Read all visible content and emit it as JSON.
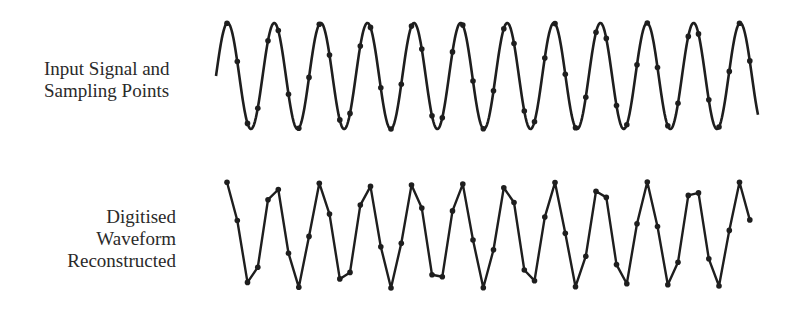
{
  "labels": {
    "top_line1": "Input Signal and",
    "top_line2": "Sampling Points",
    "bottom_line1": "Digitised",
    "bottom_line2": "Waveform",
    "bottom_line3": "Reconstructed"
  },
  "style": {
    "stroke": "#1e1e1e",
    "dot": "#1e1e1e"
  },
  "input_signal": {
    "x_start": 216,
    "x_end": 758,
    "center_y": 76,
    "amplitude": 53,
    "period_px": 46.6,
    "phase_start": 0
  },
  "reconstructed": {
    "center_y": 235,
    "amplitude": 53
  },
  "sampling": {
    "first_x": 227,
    "spacing_px": 10.25,
    "count": 53
  }
}
